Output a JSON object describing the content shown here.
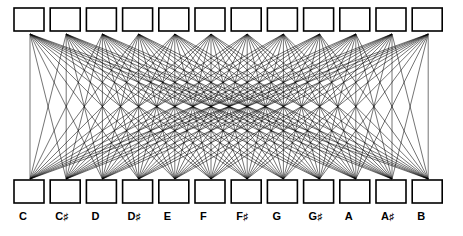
{
  "figure": {
    "background_color": "#ffffff",
    "line_color": "#000000",
    "box_fill": "#ffffff",
    "box_stroke": "#000000"
  },
  "labels": [
    {
      "id": "label-c",
      "text": "C",
      "natural": "C",
      "accidental": ""
    },
    {
      "id": "label-cs",
      "text": "C♯",
      "natural": "C",
      "accidental": "♯"
    },
    {
      "id": "label-d",
      "text": "D",
      "natural": "D",
      "accidental": ""
    },
    {
      "id": "label-ds",
      "text": "D♯",
      "natural": "D",
      "accidental": "♯"
    },
    {
      "id": "label-e",
      "text": "E",
      "natural": "E",
      "accidental": ""
    },
    {
      "id": "label-f",
      "text": "F",
      "natural": "F",
      "accidental": ""
    },
    {
      "id": "label-fs",
      "text": "F♯",
      "natural": "F",
      "accidental": "♯"
    },
    {
      "id": "label-g",
      "text": "G",
      "natural": "G",
      "accidental": ""
    },
    {
      "id": "label-gs",
      "text": "G♯",
      "natural": "G",
      "accidental": "♯"
    },
    {
      "id": "label-a",
      "text": "A",
      "natural": "A",
      "accidental": ""
    },
    {
      "id": "label-as",
      "text": "A♯",
      "natural": "A",
      "accidental": "♯"
    },
    {
      "id": "label-b",
      "text": "B",
      "natural": "B",
      "accidental": ""
    }
  ],
  "chart_data": {
    "type": "diagram",
    "subtype": "complete-bipartite-graph",
    "title": "",
    "xlabel": "",
    "ylabel": "",
    "node_count_top": 12,
    "node_count_bottom": 12,
    "edge_count": 144,
    "categories": [
      "C",
      "C♯",
      "D",
      "D♯",
      "E",
      "F",
      "F♯",
      "G",
      "G♯",
      "A",
      "A♯",
      "B"
    ],
    "top_row": {
      "label_visible": false,
      "nodes": [
        {
          "index": 0,
          "name": "C"
        },
        {
          "index": 1,
          "name": "C♯"
        },
        {
          "index": 2,
          "name": "D"
        },
        {
          "index": 3,
          "name": "D♯"
        },
        {
          "index": 4,
          "name": "E"
        },
        {
          "index": 5,
          "name": "F"
        },
        {
          "index": 6,
          "name": "F♯"
        },
        {
          "index": 7,
          "name": "G"
        },
        {
          "index": 8,
          "name": "G♯"
        },
        {
          "index": 9,
          "name": "A"
        },
        {
          "index": 10,
          "name": "A♯"
        },
        {
          "index": 11,
          "name": "B"
        }
      ]
    },
    "bottom_row": {
      "label_visible": true,
      "nodes": [
        {
          "index": 0,
          "name": "C"
        },
        {
          "index": 1,
          "name": "C♯"
        },
        {
          "index": 2,
          "name": "D"
        },
        {
          "index": 3,
          "name": "D♯"
        },
        {
          "index": 4,
          "name": "E"
        },
        {
          "index": 5,
          "name": "F"
        },
        {
          "index": 6,
          "name": "F♯"
        },
        {
          "index": 7,
          "name": "G"
        },
        {
          "index": 8,
          "name": "G♯"
        },
        {
          "index": 9,
          "name": "A"
        },
        {
          "index": 10,
          "name": "A♯"
        },
        {
          "index": 11,
          "name": "B"
        }
      ]
    },
    "geometry": {
      "box_width": 30,
      "box_height": 23,
      "box_pitch": 36.2,
      "first_box_x": 14,
      "top_box_y": 8,
      "bottom_box_y": 180,
      "top_anchor_y": 34,
      "bottom_anchor_y": 179,
      "anchor_offset_x": 16,
      "label_y": 210
    }
  }
}
